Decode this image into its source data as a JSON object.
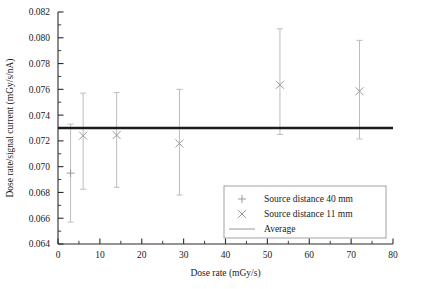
{
  "chart_data": {
    "type": "scatter",
    "title": "",
    "xlabel": "Dose rate (mGy/s)",
    "ylabel": "Dose rate/signal current (mGy/s/nA)",
    "xlim": [
      0,
      80
    ],
    "ylim": [
      0.064,
      0.082
    ],
    "xticks": [
      0,
      10,
      20,
      30,
      40,
      50,
      60,
      70,
      80
    ],
    "xtick_labels": [
      "0",
      "10",
      "20",
      "30",
      "40",
      "50",
      "60",
      "70",
      "80"
    ],
    "xtick_minor_step": 5,
    "yticks": [
      0.064,
      0.066,
      0.068,
      0.07,
      0.072,
      0.074,
      0.076,
      0.078,
      0.08,
      0.082
    ],
    "ytick_labels": [
      "0.064",
      "0.066",
      "0.068",
      "0.070",
      "0.072",
      "0.074",
      "0.076",
      "0.078",
      "0.080",
      "0.082"
    ],
    "ytick_minor_step": 0.001,
    "grid": false,
    "legend_position": "lower-right",
    "series": [
      {
        "name": "Source distance 40 mm",
        "marker": "plus",
        "color": "#9a9a9a",
        "points": [
          {
            "x": 3.0,
            "y": 0.0695,
            "yerr_low": 0.0657,
            "yerr_high": 0.0733
          }
        ]
      },
      {
        "name": "Source distance 11 mm",
        "marker": "cross",
        "color": "#9a9a9a",
        "points": [
          {
            "x": 6.0,
            "y": 0.0724,
            "yerr_low": 0.06825,
            "yerr_high": 0.0757
          },
          {
            "x": 14.0,
            "y": 0.07245,
            "yerr_low": 0.0684,
            "yerr_high": 0.07575
          },
          {
            "x": 29.0,
            "y": 0.0718,
            "yerr_low": 0.0678,
            "yerr_high": 0.076
          },
          {
            "x": 53.0,
            "y": 0.07635,
            "yerr_low": 0.0725,
            "yerr_high": 0.0807
          },
          {
            "x": 72.0,
            "y": 0.07585,
            "yerr_low": 0.07215,
            "yerr_high": 0.0798
          }
        ]
      }
    ],
    "average": {
      "name": "Average",
      "value": 0.073,
      "color": "#1c1c1c",
      "x_start": 0.0,
      "x_end": 80.0
    },
    "legend_entries": [
      {
        "label": "Source distance 40 mm",
        "marker": "plus"
      },
      {
        "label": "Source distance 11 mm",
        "marker": "cross"
      },
      {
        "label": "Average",
        "marker": "line"
      }
    ]
  }
}
